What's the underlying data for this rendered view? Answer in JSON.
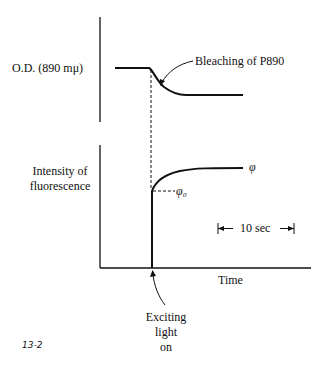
{
  "diagram": {
    "top_panel": {
      "ylabel": "O.D. (890 mμ)",
      "annotation": "Bleaching of P890"
    },
    "bottom_panel": {
      "ylabel_line1": "Intensity of",
      "ylabel_line2": "fluorescence",
      "phi_label": "φ",
      "phi0_label": "φ₀",
      "scale_bar_label": "10 sec",
      "xlabel": "Time"
    },
    "event_annotation": {
      "line1": "Exciting",
      "line2": "light",
      "line3": "on"
    },
    "figure_number": "13-2"
  },
  "colors": {
    "ink": "#111111",
    "background": "#ffffff"
  }
}
